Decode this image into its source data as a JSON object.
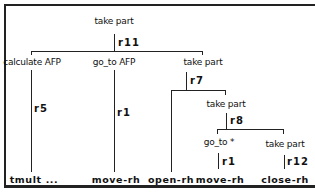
{
  "diagram": {
    "type": "parse-tree",
    "nodes": {
      "root": "take part",
      "n_calc": "calculate AFP",
      "n_goto_afp": "go_to AFP",
      "n_take2": "take part",
      "n_take3": "take part",
      "n_goto_star": "go_to *",
      "n_take4": "take part"
    },
    "rules": {
      "r_root": "r11",
      "r_calc": "r5",
      "r_goto_afp": "r1",
      "r_take2": "r7",
      "r_take3": "r8",
      "r_goto_star": "r1",
      "r_take4": "r12"
    },
    "leaves": {
      "l_tmult": "tmult ...",
      "l_move1": "move-rh",
      "l_open": "open-rh",
      "l_move2": "move-rh",
      "l_close": "close-rh"
    },
    "edges": [
      {
        "from": "take part",
        "rule": "r11",
        "to": [
          "calculate AFP",
          "go_to AFP",
          "take part"
        ]
      },
      {
        "from": "calculate AFP",
        "rule": "r5",
        "to": [
          "tmult ..."
        ]
      },
      {
        "from": "go_to AFP",
        "rule": "r1",
        "to": [
          "move-rh"
        ]
      },
      {
        "from": "take part",
        "rule": "r7",
        "to": [
          "open-rh",
          "take part"
        ]
      },
      {
        "from": "take part",
        "rule": "r8",
        "to": [
          "go_to *",
          "take part"
        ]
      },
      {
        "from": "go_to *",
        "rule": "r1",
        "to": [
          "move-rh"
        ]
      },
      {
        "from": "take part",
        "rule": "r12",
        "to": [
          "close-rh"
        ]
      }
    ]
  }
}
